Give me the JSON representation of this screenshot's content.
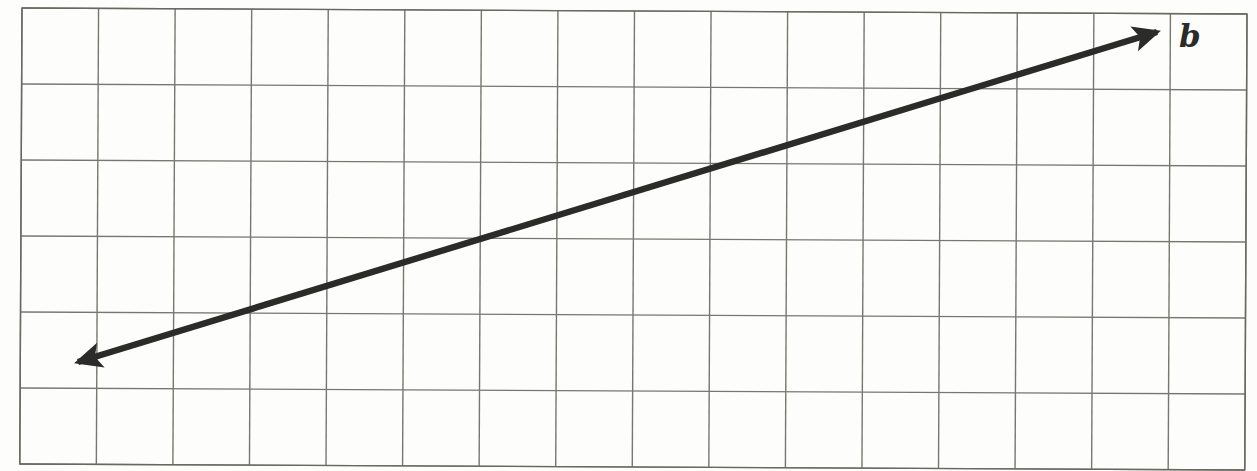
{
  "figure": {
    "type": "geometry-diagram",
    "label": "b",
    "label_x": 1179,
    "label_y": 47,
    "background": "#fdfdfb"
  },
  "grid": {
    "cols": 16,
    "rows": 6,
    "x0": 22,
    "y0": 8,
    "x1": 1247,
    "y1": 464,
    "line_color": "#77776f",
    "border_color": "#68685f",
    "line_width": 1.4,
    "tilt_deg": 0.28
  },
  "line": {
    "name": "b",
    "x1": 78,
    "y1": 362,
    "x2": 1157,
    "y2": 32,
    "color": "#2b2b27",
    "width": 6.4,
    "arrowheads": "both"
  }
}
